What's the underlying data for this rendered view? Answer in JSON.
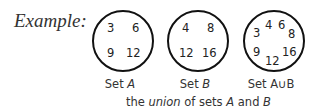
{
  "heading": "Example:",
  "sets": [
    {
      "label_prefix": "Set ",
      "label_name": "A",
      "elements": [
        "3",
        "6",
        "9",
        "12"
      ]
    },
    {
      "label_prefix": "Set ",
      "label_name": "B",
      "elements": [
        "4",
        "8",
        "12",
        "16"
      ]
    },
    {
      "label_prefix": "Set ",
      "label_name": "A∪B",
      "elements": [
        "3",
        "4",
        "6",
        "8",
        "9",
        "12",
        "16"
      ]
    }
  ],
  "caption": {
    "pre": "the ",
    "union": "union",
    "mid": " of sets ",
    "a": "A",
    "and": " and ",
    "b": "B"
  }
}
